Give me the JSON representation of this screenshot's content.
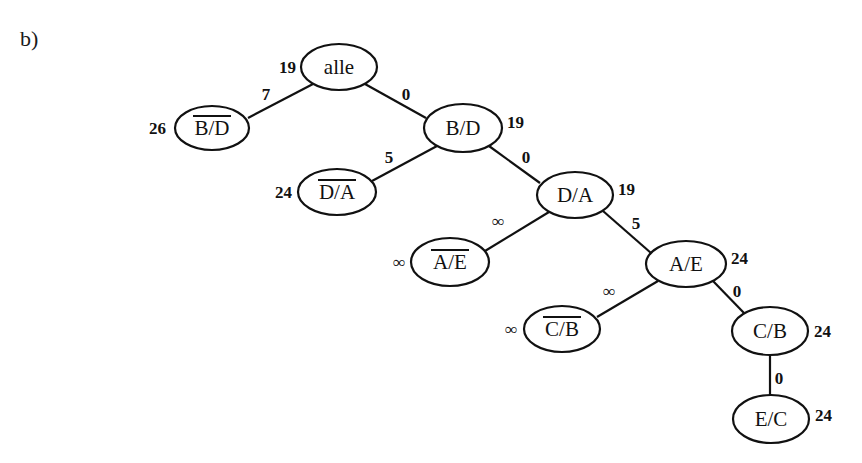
{
  "figure": {
    "part_label": "b)",
    "colors": {
      "stroke": "#111111",
      "background": "#ffffff"
    }
  },
  "tree": {
    "nodes": [
      {
        "id": "alle",
        "label": "alle",
        "negated": false,
        "cost": "19",
        "cx": 339,
        "cy": 67,
        "rx": 38,
        "ry": 23,
        "cost_x": 296,
        "cost_y": 73,
        "cost_anchor": "end"
      },
      {
        "id": "nBD",
        "label": "B/D",
        "negated": true,
        "cost": "26",
        "cx": 212,
        "cy": 128,
        "rx": 37,
        "ry": 22,
        "cost_x": 166,
        "cost_y": 134,
        "cost_anchor": "end"
      },
      {
        "id": "BD",
        "label": "B/D",
        "negated": false,
        "cost": "19",
        "cx": 463,
        "cy": 128,
        "rx": 39,
        "ry": 24,
        "cost_x": 507,
        "cost_y": 128,
        "cost_anchor": "start"
      },
      {
        "id": "nDA",
        "label": "D/A",
        "negated": true,
        "cost": "24",
        "cx": 337,
        "cy": 192,
        "rx": 39,
        "ry": 23,
        "cost_x": 292,
        "cost_y": 198,
        "cost_anchor": "end"
      },
      {
        "id": "DA",
        "label": "D/A",
        "negated": false,
        "cost": "19",
        "cx": 575,
        "cy": 195,
        "rx": 38,
        "ry": 23,
        "cost_x": 618,
        "cost_y": 195,
        "cost_anchor": "start"
      },
      {
        "id": "nAE",
        "label": "A/E",
        "negated": true,
        "cost": "∞",
        "cx": 450,
        "cy": 262,
        "rx": 39,
        "ry": 24,
        "cost_x": 405,
        "cost_y": 268,
        "cost_anchor": "end"
      },
      {
        "id": "AE",
        "label": "A/E",
        "negated": false,
        "cost": "24",
        "cx": 686,
        "cy": 264,
        "rx": 40,
        "ry": 23,
        "cost_x": 731,
        "cost_y": 264,
        "cost_anchor": "start"
      },
      {
        "id": "nCB",
        "label": "C/B",
        "negated": true,
        "cost": "∞",
        "cx": 562,
        "cy": 329,
        "rx": 38,
        "ry": 23,
        "cost_x": 517,
        "cost_y": 335,
        "cost_anchor": "end"
      },
      {
        "id": "CB",
        "label": "C/B",
        "negated": false,
        "cost": "24",
        "cx": 770,
        "cy": 331,
        "rx": 38,
        "ry": 24,
        "cost_x": 814,
        "cost_y": 337,
        "cost_anchor": "start"
      },
      {
        "id": "EC",
        "label": "E/C",
        "negated": false,
        "cost": "24",
        "cx": 771,
        "cy": 419,
        "rx": 38,
        "ry": 24,
        "cost_x": 815,
        "cost_y": 421,
        "cost_anchor": "start"
      }
    ],
    "edges": [
      {
        "from": "alle",
        "to": "nBD",
        "weight": "7",
        "x1": 313,
        "y1": 84,
        "x2": 248,
        "y2": 118,
        "lx": 266,
        "ly": 100
      },
      {
        "from": "alle",
        "to": "BD",
        "weight": "0",
        "x1": 365,
        "y1": 84,
        "x2": 426,
        "y2": 118,
        "lx": 406,
        "ly": 100
      },
      {
        "from": "BD",
        "to": "nDA",
        "weight": "5",
        "x1": 437,
        "y1": 146,
        "x2": 372,
        "y2": 181,
        "lx": 389,
        "ly": 163
      },
      {
        "from": "BD",
        "to": "DA",
        "weight": "0",
        "x1": 489,
        "y1": 146,
        "x2": 540,
        "y2": 183,
        "lx": 526,
        "ly": 163
      },
      {
        "from": "DA",
        "to": "nAE",
        "weight": "∞",
        "x1": 549,
        "y1": 212,
        "x2": 485,
        "y2": 251,
        "lx": 498,
        "ly": 227
      },
      {
        "from": "DA",
        "to": "AE",
        "weight": "5",
        "x1": 603,
        "y1": 211,
        "x2": 651,
        "y2": 253,
        "lx": 636,
        "ly": 229
      },
      {
        "from": "AE",
        "to": "nCB",
        "weight": "∞",
        "x1": 658,
        "y1": 281,
        "x2": 597,
        "y2": 317,
        "lx": 609,
        "ly": 297
      },
      {
        "from": "AE",
        "to": "CB",
        "weight": "0",
        "x1": 713,
        "y1": 281,
        "x2": 744,
        "y2": 313,
        "lx": 737,
        "ly": 297
      },
      {
        "from": "CB",
        "to": "EC",
        "weight": "0",
        "x1": 770,
        "y1": 355,
        "x2": 770,
        "y2": 395,
        "lx": 779,
        "ly": 384
      }
    ]
  }
}
